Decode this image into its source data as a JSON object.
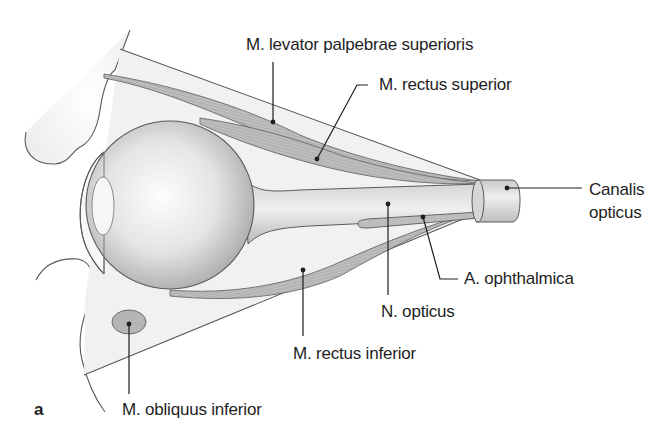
{
  "figure": {
    "panel_letter": "a",
    "labels": {
      "levator": "M. levator palpebrae superioris",
      "rectus_superior": "M. rectus superior",
      "canalis_line1": "Canalis",
      "canalis_line2": "opticus",
      "ophthalmica": "A. ophthalmica",
      "n_opticus": "N. opticus",
      "rectus_inferior": "M. rectus inferior",
      "obliquus_inferior": "M. obliquus inferior"
    },
    "colors": {
      "outline": "#555555",
      "leader": "#1e1e1e",
      "muscle": "#b9b9b9",
      "globe_light": "#fafafa",
      "globe_dark": "#a9a9a9",
      "tissue": "#eeeeee",
      "text": "#1e1e1e"
    }
  }
}
